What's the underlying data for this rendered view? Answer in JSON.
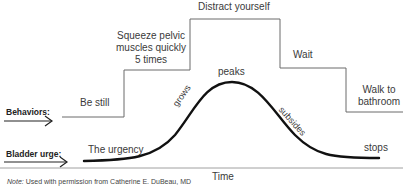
{
  "diagram": {
    "type": "urge-control timeline",
    "row_labels": {
      "behaviors": "Behaviors:",
      "bladder_urge": "Bladder urge:"
    },
    "behaviors": [
      {
        "label": "Be still"
      },
      {
        "label_lines": [
          "Squeeze pelvic",
          "muscles quickly",
          "5 times"
        ]
      },
      {
        "label": "Distract yourself"
      },
      {
        "label": "Wait"
      },
      {
        "label_lines": [
          "Walk to",
          "bathroom"
        ]
      }
    ],
    "urge_curve_labels": {
      "start": "The urgency",
      "rising": "grows",
      "top": "peaks",
      "falling": "subsides",
      "end": "stops"
    },
    "x_axis_label": "Time",
    "note_prefix": "Note:",
    "note_text": " Used with permission from Catherine E. DuBeau, MD",
    "colors": {
      "step_line": "#6a6a6a",
      "curve": "#111111",
      "axis": "#888888",
      "text": "#3a3a3a"
    }
  }
}
